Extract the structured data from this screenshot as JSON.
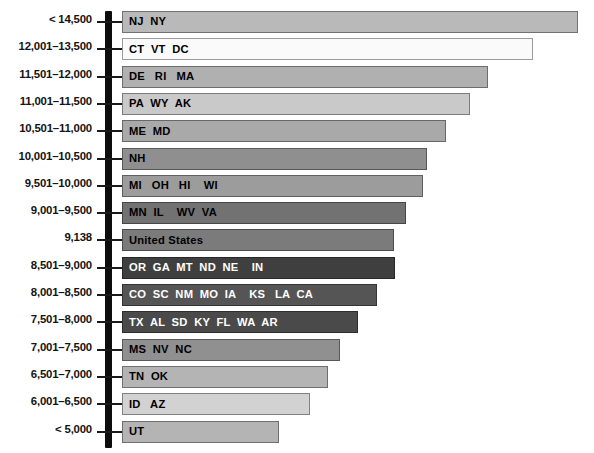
{
  "chart_data": {
    "type": "bar",
    "orientation": "horizontal",
    "title": "",
    "subtitle": "",
    "xlabel": "",
    "ylabel": "",
    "grid": false,
    "legend": null,
    "axis_note": "Categories are expenditure ranges in dollars; bar length encodes magnitude. Bars are labeled with the state postal abbreviations falling in each range.",
    "categories": [
      "< 14,500",
      "12,001–13,500",
      "11,501–12,000",
      "11,001–11,500",
      "10,501–11,000",
      "10,001–10,500",
      "9,501–10,000",
      "9,001–9,500",
      "9,138",
      "8,501–9,000",
      "8,001–8,500",
      "7,501–8,000",
      "7,001–7,500",
      "6,501–7,000",
      "6,001–6,500",
      "< 5,000"
    ],
    "bar_labels": [
      "NJ  NY",
      "CT  VT  DC",
      "DE   RI   MA",
      "PA  WY  AK",
      "ME  MD",
      "NH",
      "MI   OH   HI    WI",
      "MN  IL    WV  VA",
      "United States",
      "OR  GA  MT  ND  NE    IN",
      "CO  SC  NM  MO  IA    KS   LA  CA",
      "TX  AL  SD  KY  FL  WA  AR",
      "MS  NV  NC",
      "TN  OK",
      "ID   AZ",
      "UT"
    ],
    "values": [
      456,
      411,
      366,
      348,
      324,
      305,
      301,
      284,
      272,
      273,
      255,
      236,
      218,
      206,
      188,
      157
    ],
    "value_unit": "px-length",
    "colors": [
      "#b9b9b9",
      "#fafafa",
      "#b0b0b0",
      "#c9c9c9",
      "#a9a9a9",
      "#8f8f8f",
      "#9c9c9c",
      "#727272",
      "#7b7b7b",
      "#3f3f3f",
      "#555555",
      "#4a4a4a",
      "#909090",
      "#b4b4b4",
      "#d2d2d2",
      "#b4b4b4"
    ],
    "text_on_bar_is_white": [
      false,
      false,
      false,
      false,
      false,
      false,
      false,
      false,
      false,
      true,
      true,
      true,
      false,
      false,
      false,
      false
    ],
    "axis_color": "#0d0d0d",
    "background": "#ffffff"
  },
  "rows": [
    {
      "label": "< 14,500",
      "bar": "NJ  NY",
      "value": 456
    },
    {
      "label": "12,001–13,500",
      "bar": "CT  VT  DC",
      "value": 411
    },
    {
      "label": "11,501–12,000",
      "bar": "DE   RI   MA",
      "value": 366
    },
    {
      "label": "11,001–11,500",
      "bar": "PA  WY  AK",
      "value": 348
    },
    {
      "label": "10,501–11,000",
      "bar": "ME  MD",
      "value": 324
    },
    {
      "label": "10,001–10,500",
      "bar": "NH",
      "value": 305
    },
    {
      "label": "9,501–10,000",
      "bar": "MI   OH   HI    WI",
      "value": 301
    },
    {
      "label": "9,001–9,500",
      "bar": "MN  IL    WV  VA",
      "value": 284
    },
    {
      "label": "9,138",
      "bar": "United States",
      "value": 272
    },
    {
      "label": "8,501–9,000",
      "bar": "OR  GA  MT  ND  NE    IN",
      "value": 273
    },
    {
      "label": "8,001–8,500",
      "bar": "CO  SC  NM  MO  IA    KS   LA  CA",
      "value": 255
    },
    {
      "label": "7,501–8,000",
      "bar": "TX  AL  SD  KY  FL  WA  AR",
      "value": 236
    },
    {
      "label": "7,001–7,500",
      "bar": "MS  NV  NC",
      "value": 218
    },
    {
      "label": "6,501–7,000",
      "bar": "TN  OK",
      "value": 206
    },
    {
      "label": "6,001–6,500",
      "bar": "ID   AZ",
      "value": 188
    },
    {
      "label": "< 5,000",
      "bar": "UT",
      "value": 157
    }
  ]
}
